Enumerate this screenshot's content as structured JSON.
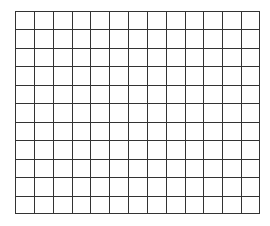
{
  "grid": {
    "columns": 13,
    "rows": 11,
    "line_color": "#333333",
    "background": "#ffffff"
  }
}
